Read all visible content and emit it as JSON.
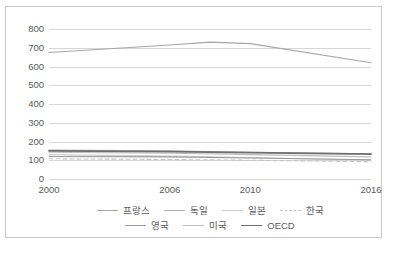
{
  "chart_data": {
    "type": "line",
    "title": "",
    "subtitle": "",
    "xlabel": "",
    "ylabel": "",
    "x": [
      2000,
      2006,
      2010,
      2016
    ],
    "x_ticks": [
      "2000",
      "2006",
      "2010",
      "2016"
    ],
    "xlim": [
      2000,
      2016
    ],
    "ylim": [
      0,
      800
    ],
    "y_ticks": [
      "0",
      "100",
      "200",
      "300",
      "400",
      "500",
      "600",
      "700",
      "800"
    ],
    "y_tick_values": [
      0,
      100,
      200,
      300,
      400,
      500,
      600,
      700,
      800
    ],
    "grid": true,
    "legend_position": "bottom",
    "series": [
      {
        "name": "프랑스",
        "color": "#a6a6a6",
        "dash": "none",
        "width": 1.1,
        "x": [
          2000,
          2006,
          2008,
          2010,
          2016
        ],
        "values": [
          675,
          715,
          730,
          722,
          620
        ]
      },
      {
        "name": "독일",
        "color": "#b0b0b0",
        "dash": "none",
        "width": 1.1,
        "x": [
          2000,
          2006,
          2010,
          2016
        ],
        "values": [
          155,
          150,
          143,
          135
        ]
      },
      {
        "name": "일본",
        "color": "#cdcdcd",
        "dash": "none",
        "width": 1.1,
        "x": [
          2000,
          2006,
          2010,
          2016
        ],
        "values": [
          130,
          122,
          115,
          100
        ]
      },
      {
        "name": "한국",
        "color": "#c4c4c4",
        "dash": "dashed",
        "width": 1.1,
        "x": [
          2000,
          2006,
          2010,
          2016
        ],
        "values": [
          108,
          104,
          100,
          92
        ]
      },
      {
        "name": "영국",
        "color": "#9a9a9a",
        "dash": "none",
        "width": 1.1,
        "x": [
          2000,
          2006,
          2010,
          2016
        ],
        "values": [
          120,
          118,
          112,
          103
        ]
      },
      {
        "name": "미국",
        "color": "#bdbdbd",
        "dash": "none",
        "width": 1.1,
        "x": [
          2000,
          2006,
          2010,
          2016
        ],
        "values": [
          143,
          137,
          130,
          118
        ]
      },
      {
        "name": "OECD",
        "color": "#6e6e6e",
        "dash": "none",
        "width": 1.8,
        "x": [
          2000,
          2006,
          2010,
          2016
        ],
        "values": [
          150,
          146,
          141,
          133
        ]
      }
    ]
  },
  "legend": {
    "row1": [
      "프랑스",
      "독일",
      "일본",
      "한국"
    ],
    "row2": [
      "영국",
      "미국",
      "OECD"
    ]
  }
}
